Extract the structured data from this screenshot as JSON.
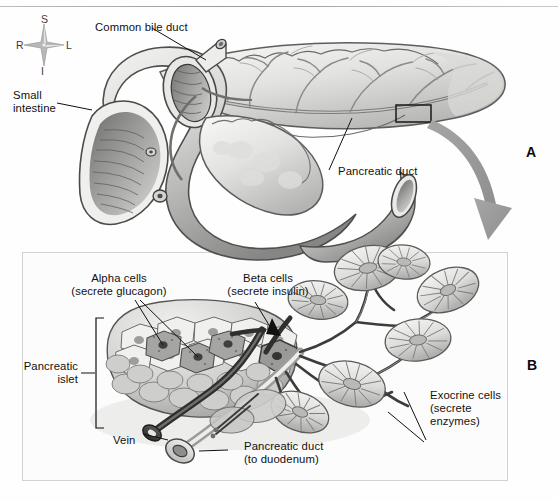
{
  "figure": {
    "panels": [
      {
        "id": "A",
        "marker": "A",
        "caption": "Gross anatomy of pancreas and duodenum"
      },
      {
        "id": "B",
        "marker": "B",
        "caption": "Microscopic detail of pancreatic islet and acinar tissue"
      }
    ]
  },
  "orientation_compass": {
    "name": "anatomical-orientation-rosette",
    "superior": "S",
    "inferior": "I",
    "right": "R",
    "left": "L"
  },
  "panel_a": {
    "labels": {
      "common_bile_duct": "Common bile duct",
      "small_intestine_line1": "Small",
      "small_intestine_line2": "intestine",
      "pancreatic_duct": "Pancreatic duct"
    },
    "inset_box": {
      "name": "magnification-inset-rectangle"
    },
    "magnifier_arrow": {
      "name": "magnification-arrow",
      "direction": "down-right"
    }
  },
  "panel_b": {
    "labels": {
      "alpha_cells_line1": "Alpha cells",
      "alpha_cells_line2": "(secrete glucagon)",
      "beta_cells_line1": "Beta cells",
      "beta_cells_line2": "(secrete insulin)",
      "pancreatic_islet_line1": "Pancreatic",
      "pancreatic_islet_line2": "islet",
      "exocrine_cells_line1": "Exocrine cells",
      "exocrine_cells_line2": "(secrete",
      "exocrine_cells_line3": "enzymes)",
      "vein": "Vein",
      "pancreatic_duct_line1": "Pancreatic duct",
      "pancreatic_duct_line2": "(to duodenum)"
    }
  },
  "colors": {
    "ink": "#111111",
    "arrow_gray": "#9a9a9a",
    "tissue_light": "#f0f0ee",
    "tissue_mid": "#c9c9c7",
    "tissue_dark": "#8d8d8b",
    "duct_dark": "#4a4a4a",
    "panel_border": "#d2d2d2",
    "background": "#fefefe"
  }
}
